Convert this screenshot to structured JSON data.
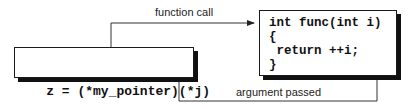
{
  "diagram": {
    "caller": {
      "code": "z = (*my_pointer)(*j)"
    },
    "callee": {
      "lines": [
        "int func(int i)",
        "{",
        " return ++i;",
        "}"
      ]
    },
    "arrows": {
      "call": {
        "label": "function call",
        "from": "caller",
        "to": "callee"
      },
      "argument": {
        "label": "argument passed",
        "from": "caller.j",
        "to": "callee.i"
      }
    },
    "colors": {
      "line": "#333333",
      "box_border": "#1a1a1a",
      "shadow": "#111111",
      "background": "#ffffff"
    }
  }
}
